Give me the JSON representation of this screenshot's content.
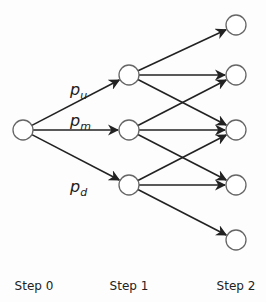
{
  "diagram": {
    "type": "trinomial-tree",
    "nodes": [
      {
        "id": "s0",
        "step": 0,
        "x": 23,
        "y": 130
      },
      {
        "id": "s1u",
        "step": 1,
        "x": 129,
        "y": 75
      },
      {
        "id": "s1m",
        "step": 1,
        "x": 129,
        "y": 130
      },
      {
        "id": "s1d",
        "step": 1,
        "x": 129,
        "y": 185
      },
      {
        "id": "s2a",
        "step": 2,
        "x": 236,
        "y": 25
      },
      {
        "id": "s2b",
        "step": 2,
        "x": 236,
        "y": 75
      },
      {
        "id": "s2c",
        "step": 2,
        "x": 236,
        "y": 130
      },
      {
        "id": "s2d",
        "step": 2,
        "x": 236,
        "y": 185
      },
      {
        "id": "s2e",
        "step": 2,
        "x": 236,
        "y": 240
      }
    ],
    "edges": [
      [
        "s0",
        "s1u"
      ],
      [
        "s0",
        "s1m"
      ],
      [
        "s0",
        "s1d"
      ],
      [
        "s1u",
        "s2a"
      ],
      [
        "s1u",
        "s2b"
      ],
      [
        "s1u",
        "s2c"
      ],
      [
        "s1m",
        "s2b"
      ],
      [
        "s1m",
        "s2c"
      ],
      [
        "s1m",
        "s2d"
      ],
      [
        "s1d",
        "s2c"
      ],
      [
        "s1d",
        "s2d"
      ],
      [
        "s1d",
        "s2e"
      ]
    ],
    "probabilities": [
      {
        "base": "p",
        "sub": "u",
        "x": 70,
        "y": 95
      },
      {
        "base": "p",
        "sub": "m",
        "x": 70,
        "y": 126
      },
      {
        "base": "p",
        "sub": "d",
        "x": 70,
        "y": 192
      }
    ],
    "step_labels": [
      {
        "text": "Step 0",
        "x": 34
      },
      {
        "text": "Step 1",
        "x": 129
      },
      {
        "text": "Step 2",
        "x": 236
      }
    ]
  },
  "colors": {
    "node_stroke": "#666666",
    "edge": "#222222",
    "background": "#fdfdfd"
  }
}
